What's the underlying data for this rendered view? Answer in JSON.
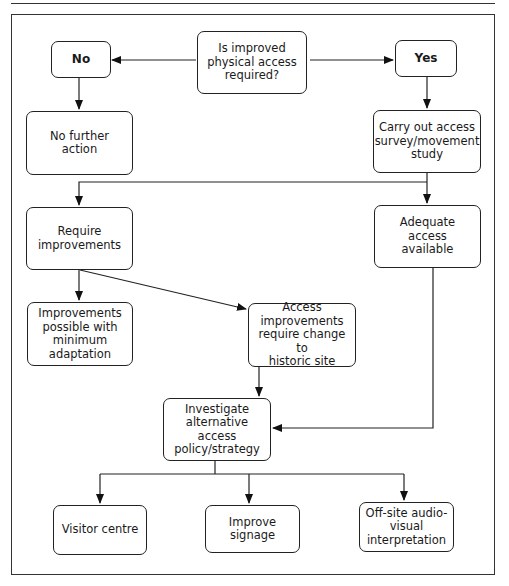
{
  "diagram": {
    "type": "flowchart",
    "nodes": {
      "question": "Is improved\nphysical access\nrequired?",
      "no": "No",
      "yes": "Yes",
      "no_further_action": "No further\naction",
      "carry_out_survey": "Carry out access\nsurvey/movement\nstudy",
      "require_improvements": "Require\nimprovements",
      "adequate_access": "Adequate access\navailable",
      "improvements_minimum": "Improvements\npossible with\nminimum\nadaptation",
      "access_improvements_change": "Access\nimprovements\nrequire change to\nhistoric site",
      "investigate_alternative": "Investigate\nalternative access\npolicy/strategy",
      "visitor_centre": "Visitor centre",
      "improve_signage": "Improve signage",
      "offsite_av": "Off-site audio-\nvisual\ninterpretation"
    },
    "edges": [
      {
        "from": "question",
        "to": "no"
      },
      {
        "from": "question",
        "to": "yes"
      },
      {
        "from": "no",
        "to": "no_further_action"
      },
      {
        "from": "yes",
        "to": "carry_out_survey"
      },
      {
        "from": "carry_out_survey",
        "to": "require_improvements"
      },
      {
        "from": "carry_out_survey",
        "to": "adequate_access"
      },
      {
        "from": "require_improvements",
        "to": "improvements_minimum"
      },
      {
        "from": "require_improvements",
        "to": "access_improvements_change"
      },
      {
        "from": "access_improvements_change",
        "to": "investigate_alternative"
      },
      {
        "from": "adequate_access",
        "to": "investigate_alternative"
      },
      {
        "from": "investigate_alternative",
        "to": "visitor_centre"
      },
      {
        "from": "investigate_alternative",
        "to": "improve_signage"
      },
      {
        "from": "investigate_alternative",
        "to": "offsite_av"
      }
    ]
  }
}
